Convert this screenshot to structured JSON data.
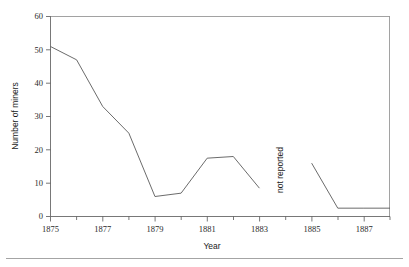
{
  "chart_data": {
    "type": "line",
    "title": "",
    "xlabel": "Year",
    "ylabel": "Number of miners",
    "xlim": [
      1875,
      1888
    ],
    "ylim": [
      0,
      60
    ],
    "grid": false,
    "legend": null,
    "x_major_ticks": [
      1875,
      1877,
      1879,
      1881,
      1883,
      1885,
      1887
    ],
    "x_major_tick_labels": [
      "1875",
      "1877",
      "1879",
      "1881",
      "1883",
      "1885",
      "1887"
    ],
    "x_minor_ticks": [
      1876,
      1878,
      1880,
      1882,
      1884,
      1886,
      1888
    ],
    "y_ticks": [
      0,
      10,
      20,
      30,
      40,
      50,
      60
    ],
    "y_tick_labels": [
      "0",
      "10",
      "20",
      "30",
      "40",
      "50",
      "60"
    ],
    "annotations": [
      {
        "text": "not reported",
        "x": 1884,
        "y": 14,
        "rotation": 90
      }
    ],
    "series": [
      {
        "name": "Number of miners",
        "color": "#5a5a5a",
        "segments": [
          {
            "name": "reported-1875-1883",
            "x": [
              1875,
              1876,
              1877,
              1878,
              1879,
              1880,
              1881,
              1882,
              1883
            ],
            "values": [
              51,
              47,
              33,
              25,
              6,
              7,
              17.5,
              18,
              8.5
            ]
          },
          {
            "name": "reported-1885-1888",
            "x": [
              1885,
              1886,
              1887,
              1888
            ],
            "values": [
              16,
              2.5,
              2.5,
              2.5
            ]
          }
        ]
      }
    ]
  },
  "figure": {
    "background": "#ffffff",
    "line_color": "#5a5a5a",
    "axis_color": "#555555",
    "frame_color": "#8a8a8a",
    "footer_rule_color": "#9a9a9a"
  }
}
